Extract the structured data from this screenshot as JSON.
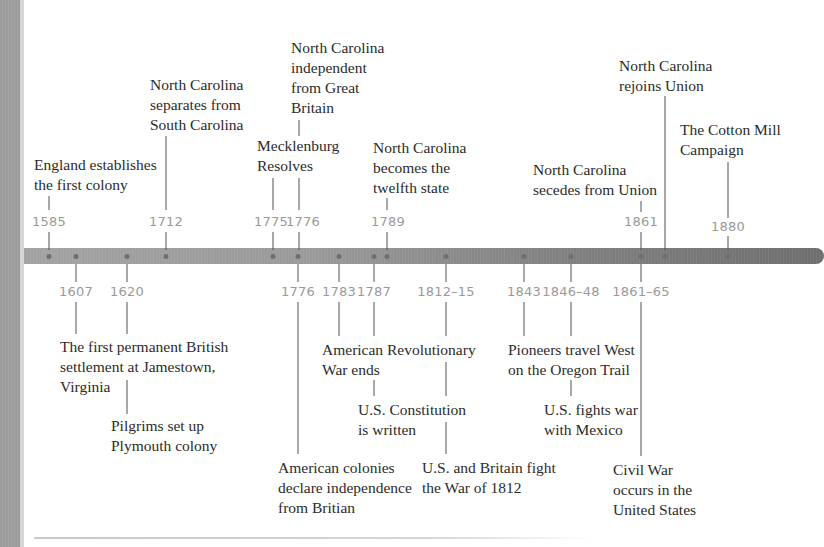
{
  "colors": {
    "bar_start": "#a2a2a2",
    "bar_end": "#6e6e6e",
    "year_text": "#9a9a9a",
    "event_text": "#2b2b2b",
    "left_stripe": "#9c9c9c"
  },
  "north_carolina_events": [
    {
      "year": "1585",
      "text": [
        "England establishes",
        "the first colony"
      ]
    },
    {
      "year": "1712",
      "text": [
        "North Carolina",
        "separates from",
        "South Carolina"
      ]
    },
    {
      "year": "1775",
      "text": [
        "Mecklenburg",
        "Resolves"
      ]
    },
    {
      "year": "1776",
      "text": [
        "North Carolina",
        "independent",
        "from Great",
        "Britain"
      ]
    },
    {
      "year": "1789",
      "text": [
        "North Carolina",
        "becomes the",
        "twelfth state"
      ]
    },
    {
      "year": "1861",
      "text": [
        "North Carolina",
        "secedes from Union"
      ]
    },
    {
      "year": "",
      "text": [
        "North Carolina",
        "rejoins Union"
      ]
    },
    {
      "year": "1880",
      "text": [
        "The Cotton Mill",
        "Campaign"
      ]
    }
  ],
  "us_events": [
    {
      "year": "1607",
      "text": [
        "The first permanent British",
        "settlement at Jamestown,",
        "Virginia"
      ]
    },
    {
      "year": "1620",
      "text": [
        "Pilgrims set up",
        "Plymouth colony"
      ]
    },
    {
      "year": "1776",
      "text": [
        "American colonies",
        "declare independence",
        "from Britian"
      ]
    },
    {
      "year": "1783",
      "text": [
        "American Revolutionary",
        "War ends"
      ]
    },
    {
      "year": "1787",
      "text": [
        "U.S. Constitution",
        "is written"
      ]
    },
    {
      "year": "1812–15",
      "text": [
        "U.S. and Britain fight",
        "the War of 1812"
      ]
    },
    {
      "year": "1843",
      "text": [
        "Pioneers travel West",
        "on the Oregon Trail"
      ]
    },
    {
      "year": "1846–48",
      "text": [
        "U.S. fights war",
        "with Mexico"
      ]
    },
    {
      "year": "1861–65",
      "text": [
        "Civil War",
        "occurs in the",
        "United States"
      ]
    }
  ]
}
